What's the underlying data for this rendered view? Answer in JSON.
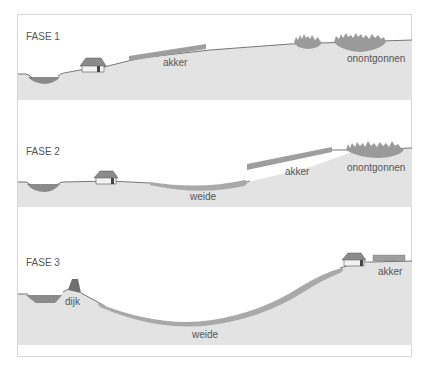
{
  "diagram": {
    "colors": {
      "ground": "#e3e3e3",
      "water": "#8a8a8a",
      "land_strip": "#9e9e9e",
      "meadow": "#a9a9a9",
      "forest": "#9a9a9a",
      "outline": "#555555",
      "text": "#555555",
      "frame": "#d6d6d6"
    },
    "phases": [
      {
        "label": "FASE 1",
        "labels": {
          "akker": "akker",
          "onontgonnen": "onontgonnen"
        }
      },
      {
        "label": "FASE 2",
        "labels": {
          "weide": "weide",
          "akker": "akker",
          "onontgonnen": "onontgonnen"
        }
      },
      {
        "label": "FASE 3",
        "labels": {
          "dijk": "dijk",
          "weide": "weide",
          "akker": "akker"
        }
      }
    ]
  }
}
